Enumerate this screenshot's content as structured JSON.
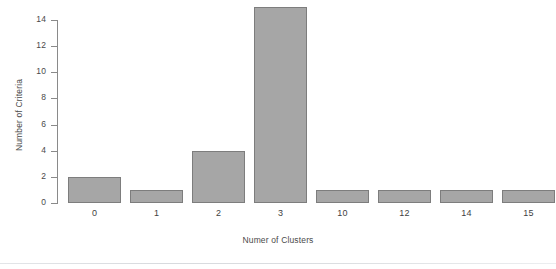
{
  "chart_data": {
    "type": "bar",
    "title": "",
    "subtitle": "",
    "xlabel": "Numer of Clusters",
    "ylabel": "Number of Criteria",
    "categories": [
      "0",
      "1",
      "2",
      "3",
      "10",
      "12",
      "14",
      "15"
    ],
    "values": [
      2,
      1,
      4,
      15,
      1,
      1,
      1,
      1
    ],
    "series": [
      {
        "name": "Number of Criteria",
        "values": [
          2,
          1,
          4,
          15,
          1,
          1,
          1,
          1
        ]
      }
    ],
    "yticks": [
      "0",
      "2",
      "4",
      "6",
      "8",
      "10",
      "12",
      "14"
    ],
    "ytick_values": [
      0,
      2,
      4,
      6,
      8,
      10,
      12,
      14
    ],
    "ylim": [
      0,
      15
    ],
    "grid": false,
    "legend": false,
    "legend_position": "none",
    "bar_fill_color": "#a6a6a6",
    "bar_border_color": "#7d7d7d",
    "axis_color": "#8a8a8a",
    "background_color": "#ffffff",
    "text_color": "#4a4a4a"
  }
}
